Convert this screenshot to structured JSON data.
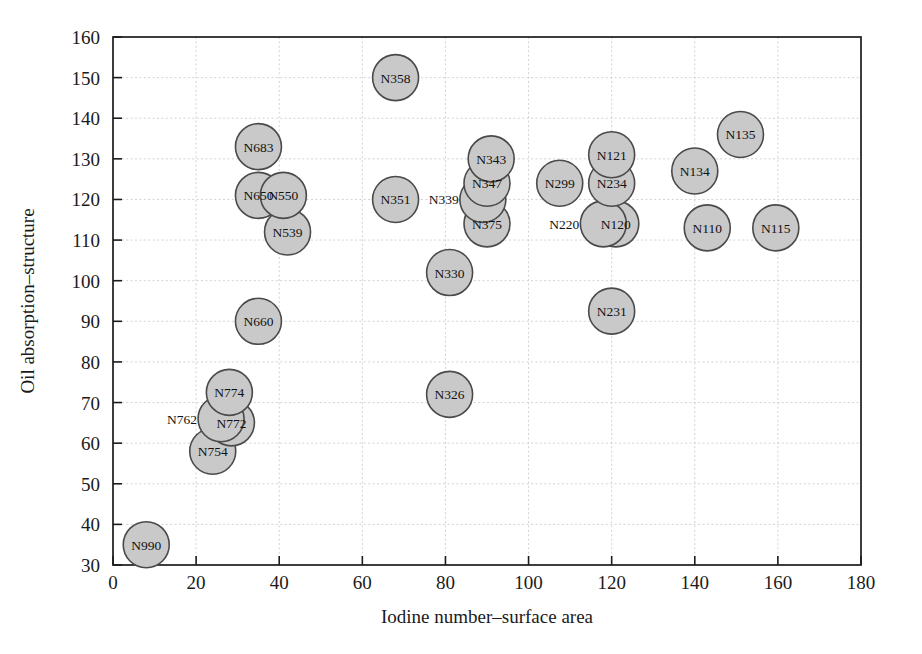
{
  "figure": {
    "kind": "scatter-plot",
    "background": "#ffffff",
    "marker_fill": "#c9c9c9",
    "marker_stroke": "#4a4a4a",
    "grid_color": "#c8c8c8",
    "frame_color": "#1c1c1c"
  },
  "chart_data": {
    "type": "scatter",
    "title": "",
    "xlabel": "Iodine number–surface area",
    "ylabel": "Oil absorption–structure",
    "xlim": [
      0,
      180
    ],
    "ylim": [
      30,
      160
    ],
    "xticks": [
      0,
      20,
      40,
      60,
      80,
      100,
      120,
      140,
      160,
      180
    ],
    "yticks": [
      30,
      40,
      50,
      60,
      70,
      80,
      90,
      100,
      110,
      120,
      130,
      140,
      150,
      160
    ],
    "xtick_labels": [
      "0",
      "20",
      "40",
      "60",
      "80",
      "100",
      "120",
      "140",
      "160",
      "180"
    ],
    "ytick_labels": [
      "30",
      "40",
      "50",
      "60",
      "70",
      "80",
      "90",
      "100",
      "110",
      "120",
      "130",
      "140",
      "150",
      "160"
    ],
    "grid": true,
    "legend": null,
    "marker_shape": "circle",
    "marker_radius_px": 23,
    "points": [
      {
        "label": "N990",
        "x": 8,
        "y": 35,
        "label_pos": "center"
      },
      {
        "label": "N754",
        "x": 24,
        "y": 58,
        "label_pos": "center"
      },
      {
        "label": "N772",
        "x": 28.5,
        "y": 65,
        "label_pos": "center"
      },
      {
        "label": "N762",
        "x": 26,
        "y": 66,
        "label_pos": "left"
      },
      {
        "label": "N774",
        "x": 28,
        "y": 72.5,
        "label_pos": "center"
      },
      {
        "label": "N660",
        "x": 35,
        "y": 90,
        "label_pos": "center"
      },
      {
        "label": "N539",
        "x": 42,
        "y": 112,
        "label_pos": "center"
      },
      {
        "label": "N650",
        "x": 35,
        "y": 121,
        "label_pos": "center"
      },
      {
        "label": "N550",
        "x": 41,
        "y": 121,
        "label_pos": "center"
      },
      {
        "label": "N683",
        "x": 35,
        "y": 133,
        "label_pos": "center"
      },
      {
        "label": "N326",
        "x": 81,
        "y": 72,
        "label_pos": "center"
      },
      {
        "label": "N330",
        "x": 81,
        "y": 102,
        "label_pos": "center"
      },
      {
        "label": "N351",
        "x": 68,
        "y": 120,
        "label_pos": "center"
      },
      {
        "label": "N358",
        "x": 68,
        "y": 150,
        "label_pos": "center"
      },
      {
        "label": "N375",
        "x": 90,
        "y": 114,
        "label_pos": "center"
      },
      {
        "label": "N339",
        "x": 89,
        "y": 120,
        "label_pos": "left"
      },
      {
        "label": "N347",
        "x": 90,
        "y": 124,
        "label_pos": "center"
      },
      {
        "label": "N343",
        "x": 91,
        "y": 130,
        "label_pos": "center"
      },
      {
        "label": "N231",
        "x": 120,
        "y": 92.5,
        "label_pos": "center"
      },
      {
        "label": "N120",
        "x": 121,
        "y": 114,
        "label_pos": "center"
      },
      {
        "label": "N220",
        "x": 118,
        "y": 114,
        "label_pos": "left"
      },
      {
        "label": "N299",
        "x": 107.5,
        "y": 124,
        "label_pos": "center"
      },
      {
        "label": "N234",
        "x": 120,
        "y": 124,
        "label_pos": "center"
      },
      {
        "label": "N121",
        "x": 120,
        "y": 131,
        "label_pos": "center"
      },
      {
        "label": "N110",
        "x": 143,
        "y": 113,
        "label_pos": "center"
      },
      {
        "label": "N115",
        "x": 159.5,
        "y": 113,
        "label_pos": "center"
      },
      {
        "label": "N134",
        "x": 140,
        "y": 127,
        "label_pos": "center"
      },
      {
        "label": "N135",
        "x": 151,
        "y": 136,
        "label_pos": "center"
      }
    ]
  }
}
